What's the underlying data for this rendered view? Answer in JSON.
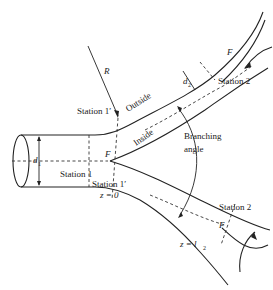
{
  "figure": {
    "labels": {
      "radius": "R",
      "outside": "Outside",
      "inside": "Inside",
      "flow_divider_center": "F",
      "flow_divider_upper": "F",
      "flow_divider_lower": "F",
      "inlet_diameter": "d",
      "inlet_diameter_sub": "1",
      "branch_diameter": "d",
      "branch_diameter_sub": "2",
      "station_1": "Station 1",
      "station_1_prime_top": "Station 1′",
      "station_1_prime_bottom": "Station 1′",
      "z_zero": "z = 0",
      "station_2_upper": "Station 2",
      "station_2_lower": "Station 2",
      "z_l2": "z = l",
      "z_l2_sub": "2",
      "branching_angle_line1": "Branching",
      "branching_angle_line2": "angle"
    },
    "colors": {
      "line": "#222222",
      "background": "#ffffff"
    }
  }
}
